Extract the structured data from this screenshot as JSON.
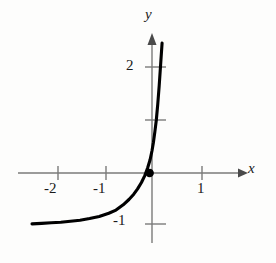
{
  "figure": {
    "background_color": "#fdfdfc",
    "ink_color": "#111111",
    "axis_color": "#7a7a7a",
    "curve_color": "#000000"
  },
  "axes": {
    "x_axis_label": "x",
    "y_axis_label": "y",
    "x_tick_labels": [
      "-2",
      "-1",
      "1"
    ],
    "y_tick_labels": [
      "2",
      "-1"
    ]
  },
  "chart_data": {
    "type": "line",
    "title": "",
    "xlabel": "x",
    "ylabel": "y",
    "xlim": [
      -2.5,
      1.85
    ],
    "ylim": [
      -1.45,
      2.55
    ],
    "grid": false,
    "legend": null,
    "x_ticks": [
      -2,
      -1,
      1
    ],
    "x_tick_labels": [
      "-2",
      "-1",
      "1"
    ],
    "y_ticks": [
      2,
      1,
      -1
    ],
    "y_tick_labels": [
      "2",
      "",
      "-1"
    ],
    "asymptote": -1,
    "series": [
      {
        "name": "exponential-curve",
        "x": [
          -2.5,
          -2.3,
          -2.1,
          -1.9,
          -1.7,
          -1.5,
          -1.3,
          -1.1,
          -0.9,
          -0.75,
          -0.6,
          -0.48,
          -0.38,
          -0.3,
          -0.22,
          -0.15,
          -0.09,
          -0.04,
          0.0,
          0.03,
          0.06,
          0.09,
          0.12,
          0.15,
          0.18,
          0.21
        ],
        "y": [
          -0.96,
          -0.95,
          -0.94,
          -0.93,
          -0.91,
          -0.89,
          -0.86,
          -0.82,
          -0.76,
          -0.7,
          -0.6,
          -0.5,
          -0.4,
          -0.3,
          -0.18,
          -0.05,
          0.1,
          0.25,
          0.42,
          0.58,
          0.78,
          1.0,
          1.3,
          1.65,
          2.05,
          2.45
        ]
      }
    ],
    "marked_points": [
      {
        "name": "origin-point",
        "x": -0.05,
        "y": 0.0,
        "style": "filled-dot"
      }
    ]
  }
}
